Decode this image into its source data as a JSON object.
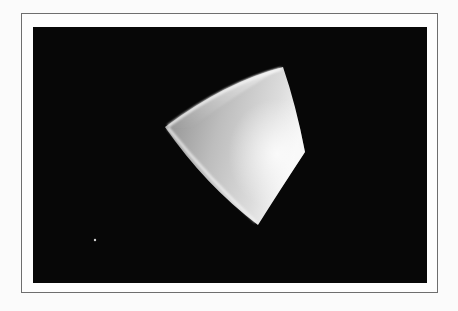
{
  "figure": {
    "colors": {
      "background": "#070707",
      "frame_border": "#6e6e6e",
      "page": "#fbfbfb",
      "surface_light": "#f2f2f2",
      "surface_mid": "#bdbdbd",
      "surface_dark": "#8a8a8a"
    },
    "shape_vertices": {
      "top": [
        283,
        67
      ],
      "left": [
        165,
        127
      ],
      "right": [
        305,
        152
      ],
      "bottom": [
        258,
        225
      ]
    },
    "speck": [
      95,
      240
    ]
  }
}
